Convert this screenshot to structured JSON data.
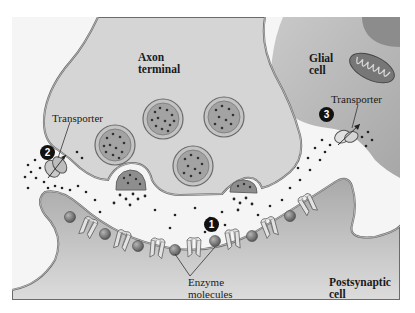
{
  "figure": {
    "labels": {
      "axon_terminal": [
        "Axon",
        "terminal"
      ],
      "glial_cell": [
        "Glial",
        "cell"
      ],
      "postsynaptic_cell": [
        "Postsynaptic",
        "cell"
      ],
      "transporter_left": "Transporter",
      "transporter_right": "Transporter",
      "enzyme_molecules": [
        "Enzyme",
        "molecules"
      ]
    },
    "markers": [
      {
        "id": 1,
        "label": "1",
        "meaning": "enzymatic degradation"
      },
      {
        "id": 2,
        "label": "2",
        "meaning": "reuptake into axon terminal"
      },
      {
        "id": 3,
        "label": "3",
        "meaning": "uptake into glial cell"
      }
    ],
    "colors": {
      "background_cleft": "#f4f4f4",
      "axon_terminal_fill": "#d4d4d4",
      "glial_fill": "#b9b9b9",
      "postsynaptic_fill": "#bdbdbd",
      "membrane_stroke": "#6e6e6e",
      "vesicle_fill": "#9a9a9a",
      "enzyme_fill": "#7a7a7a",
      "mitochondrion_fill": "#7d7d7d",
      "nucleus_fill": "#8f8f8f",
      "neurotransmitter_dot": "#222222"
    }
  }
}
